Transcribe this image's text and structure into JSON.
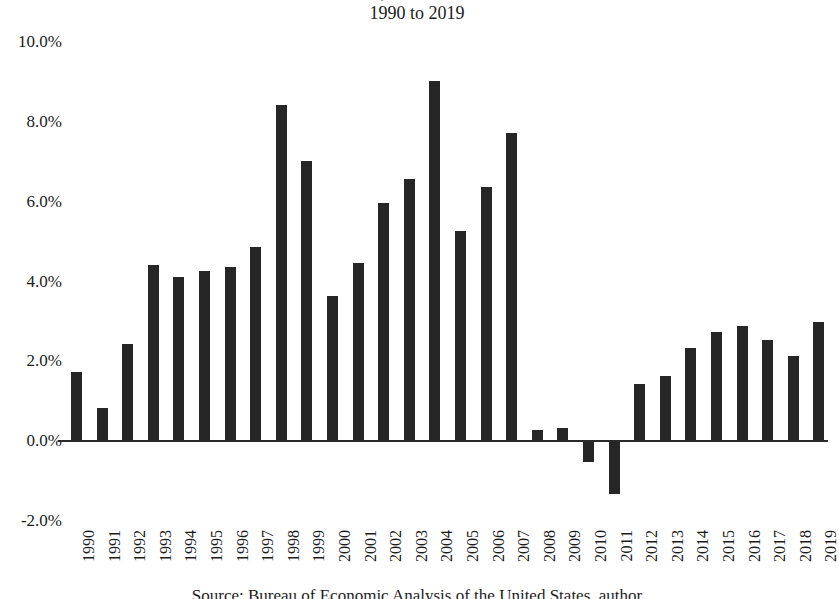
{
  "chart_data": {
    "type": "bar",
    "title": "Annual Growth Rate, Real Gross Domestic Product",
    "subtitle": "1990 to 2019",
    "caption": "Source: Bureau of Economic Analysis of the United States, author",
    "xlabel": "",
    "ylabel": "",
    "ylim": [
      -2.0,
      10.0
    ],
    "ytick_labels": [
      "10.0%",
      "8.0%",
      "6.0%",
      "4.0%",
      "2.0%",
      "0.0%",
      "-2.0%"
    ],
    "ytick_values": [
      10.0,
      8.0,
      6.0,
      4.0,
      2.0,
      0.0,
      -2.0
    ],
    "grid": false,
    "legend": "none",
    "bar_color": "#262626",
    "categories": [
      "1990",
      "1991",
      "1992",
      "1993",
      "1994",
      "1995",
      "1996",
      "1997",
      "1998",
      "1999",
      "2000",
      "2001",
      "2002",
      "2003",
      "2004",
      "2005",
      "2006",
      "2007",
      "2008",
      "2009",
      "2010",
      "2011",
      "2012",
      "2013",
      "2014",
      "2015",
      "2016",
      "2017",
      "2018",
      "2019"
    ],
    "values": [
      1.7,
      0.8,
      2.4,
      4.4,
      4.1,
      4.25,
      4.35,
      4.85,
      8.4,
      7.0,
      3.6,
      4.45,
      5.95,
      6.55,
      9.0,
      5.25,
      6.35,
      7.7,
      0.25,
      0.3,
      -0.5,
      -1.3,
      1.4,
      1.6,
      2.3,
      2.7,
      2.85,
      2.5,
      2.1,
      2.95
    ]
  }
}
